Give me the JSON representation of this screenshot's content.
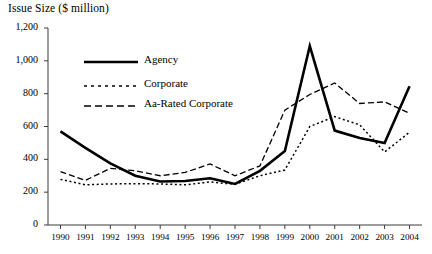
{
  "chart_data": {
    "type": "line",
    "title": "Issue Size ($ million)",
    "xlabel": "",
    "ylabel": "",
    "ylim": [
      0,
      1200
    ],
    "ytick_values": [
      0,
      200,
      400,
      600,
      800,
      1000,
      1200
    ],
    "ytick_labels": [
      "0",
      "200",
      "400",
      "600",
      "800",
      "1,000",
      "1,200"
    ],
    "grid": false,
    "legend_position": "upper-left-inside",
    "categories": [
      "1990",
      "1991",
      "1992",
      "1993",
      "1994",
      "1995",
      "1996",
      "1997",
      "1998",
      "1999",
      "2000",
      "2001",
      "2002",
      "2003",
      "2004"
    ],
    "x": [
      1990,
      1991,
      1992,
      1993,
      1994,
      1995,
      1996,
      1997,
      1998,
      1999,
      2000,
      2001,
      2002,
      2003,
      2004
    ],
    "series": [
      {
        "name": "Agency",
        "style": "solid",
        "width": 2.6,
        "color": "#000000",
        "values": [
          570,
          470,
          375,
          300,
          265,
          268,
          285,
          250,
          330,
          450,
          1090,
          575,
          530,
          500,
          845
        ]
      },
      {
        "name": "Corporate",
        "style": "dotted",
        "width": 1.5,
        "color": "#000000",
        "values": [
          278,
          245,
          250,
          252,
          250,
          245,
          262,
          248,
          300,
          335,
          600,
          660,
          610,
          445,
          565
        ]
      },
      {
        "name": "Aa-Rated Corporate",
        "style": "dashed",
        "width": 1.3,
        "color": "#000000",
        "values": [
          325,
          272,
          345,
          330,
          300,
          320,
          372,
          300,
          360,
          700,
          795,
          865,
          740,
          750,
          680
        ]
      }
    ]
  },
  "legend": {
    "items": [
      {
        "label": "Agency",
        "swatch": "solid-line-swatch"
      },
      {
        "label": "Corporate",
        "swatch": "dotted-line-swatch"
      },
      {
        "label": "Aa-Rated Corporate",
        "swatch": "dashed-line-swatch"
      }
    ]
  }
}
